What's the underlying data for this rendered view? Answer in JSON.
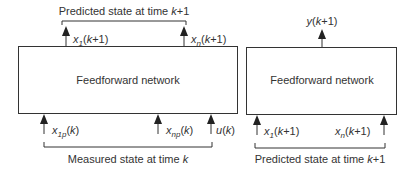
{
  "left_block": {
    "title": "Feedforward network",
    "top_bracket_label": "Predicted state at time k+1",
    "top_bracket_label_parts": [
      "Predicted state at time ",
      "k",
      "+1"
    ],
    "outputs": [
      {
        "var": "x",
        "sub": "1",
        "arg": "(k+1)"
      },
      {
        "var": "x",
        "sub": "n",
        "arg": "(k+1)"
      }
    ],
    "inputs": [
      {
        "var": "x",
        "sub": "1p",
        "arg": "(k)"
      },
      {
        "var": "x",
        "sub": "np",
        "arg": "(k)"
      },
      {
        "var": "u",
        "sub": "",
        "arg": "(k)"
      }
    ],
    "bottom_bracket_label_parts": [
      "Measured state at time ",
      "k"
    ]
  },
  "right_block": {
    "title": "Feedforward network",
    "outputs": [
      {
        "var": "y",
        "sub": "",
        "arg": "(k+1)"
      }
    ],
    "inputs": [
      {
        "var": "x",
        "sub": "1",
        "arg": "(k+1)"
      },
      {
        "var": "x",
        "sub": "n",
        "arg": "(k+1)"
      }
    ],
    "bottom_bracket_label_parts": [
      "Predicted state at time ",
      "k",
      "+1"
    ]
  },
  "colors": {
    "stroke": "#333333",
    "text": "#333333",
    "background": "#ffffff"
  }
}
